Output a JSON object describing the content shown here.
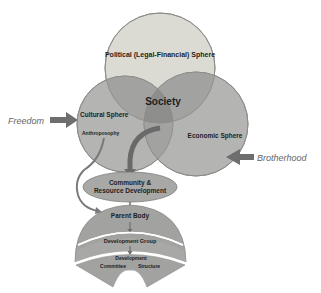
{
  "diagram": {
    "spheres": {
      "political": "Political (Legal-Financial) Sphere",
      "cultural": "Cultural Sphere",
      "cultural_sub": "Anthroposophy",
      "economic": "Economic Sphere",
      "center": "Society"
    },
    "inputs": {
      "left": "Freedom",
      "right": "Brotherhood"
    },
    "flow": {
      "community_line1": "Community &",
      "community_line2": "Resource Development",
      "parent_body": "Parent Body",
      "development_group": "Development Group",
      "dev_committee_line1": "Development",
      "dev_committee_line2_a": "Committee",
      "dev_committee_line2_b": "Structure"
    },
    "colors": {
      "political_fill": "#dcdbd3",
      "sphere_fill": "#b4b4b2",
      "overlap_fill": "#9c9c9a",
      "center_fill": "#8c8c8a",
      "arrow": "#6e6e6e",
      "outline": "#8a8a88"
    }
  }
}
